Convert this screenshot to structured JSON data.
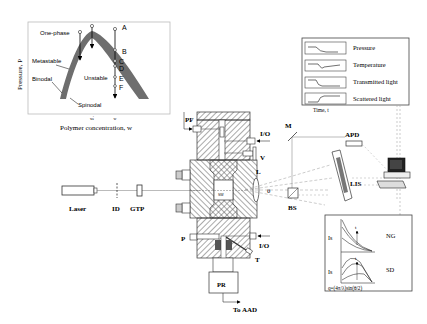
{
  "phase_diagram": {
    "ylabel": "Pressure, P",
    "xlabel": "Polymer concentration, w",
    "regions": {
      "one_phase": "One-phase",
      "metastable": "Metastable",
      "binodal": "Binodal",
      "unstable": "Unstable",
      "spinodal": "Spinodal"
    },
    "points": [
      "A",
      "B",
      "C",
      "D",
      "E",
      "F"
    ],
    "x_ticks": [
      "wⱼ",
      "w"
    ]
  },
  "legend_panel": {
    "items": [
      "Pressure",
      "Temperature",
      "Transmitted light",
      "Scattered light"
    ],
    "footer": "Time, t"
  },
  "scattering_panel": {
    "ylabel_top": "Is",
    "ylabel_bottom": "Is",
    "label_top": "NG",
    "label_bottom": "SD",
    "arrow_label": "t",
    "xlabel": "q=(4π/λ)sin(θ/2)"
  },
  "components": {
    "laser": "Laser",
    "id": "ID",
    "gtp": "GTP",
    "pf": "PF",
    "io_top": "I/O",
    "valve": "V",
    "lens": "L",
    "theta": "θ",
    "mirror": "M",
    "apd": "APD",
    "lis": "LIS",
    "bs": "BS",
    "p": "P",
    "io_bottom": "I/O",
    "t": "T",
    "pr": "PR",
    "to_aad": "To AAD",
    "cell_label": "SW"
  }
}
